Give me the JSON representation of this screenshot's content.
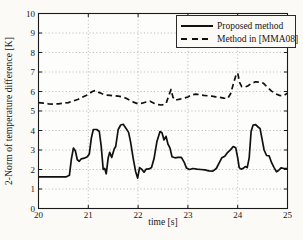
{
  "figure": {
    "ylabel": "2-Norm of temperature difference [K]",
    "xlabel": "time [s]"
  },
  "chart_data": {
    "type": "line",
    "title": "",
    "xlabel": "time [s]",
    "ylabel": "2-Norm of temperature difference [K]",
    "xlim": [
      20,
      25
    ],
    "ylim": [
      0,
      10
    ],
    "xticks": [
      20,
      21,
      22,
      23,
      24,
      25
    ],
    "yticks": [
      0,
      1,
      2,
      3,
      4,
      5,
      6,
      7,
      8,
      9,
      10
    ],
    "grid": true,
    "legend_position": "top-right",
    "axis_color": "#1a1a1a",
    "grid_color": "#9a9a9a",
    "series": [
      {
        "name": "Proposed method",
        "line_style": "solid",
        "color": "#101010",
        "points": [
          [
            20.0,
            1.62
          ],
          [
            20.3,
            1.62
          ],
          [
            20.55,
            1.62
          ],
          [
            20.62,
            1.7
          ],
          [
            20.66,
            2.55
          ],
          [
            20.7,
            3.1
          ],
          [
            20.74,
            2.95
          ],
          [
            20.78,
            2.5
          ],
          [
            20.82,
            2.42
          ],
          [
            20.86,
            2.55
          ],
          [
            20.92,
            2.58
          ],
          [
            20.98,
            2.65
          ],
          [
            21.02,
            2.8
          ],
          [
            21.06,
            3.6
          ],
          [
            21.1,
            4.05
          ],
          [
            21.17,
            4.05
          ],
          [
            21.22,
            3.95
          ],
          [
            21.26,
            3.2
          ],
          [
            21.3,
            2.0
          ],
          [
            21.33,
            2.05
          ],
          [
            21.36,
            1.78
          ],
          [
            21.4,
            2.6
          ],
          [
            21.43,
            2.88
          ],
          [
            21.47,
            2.62
          ],
          [
            21.52,
            3.05
          ],
          [
            21.55,
            3.18
          ],
          [
            21.6,
            4.05
          ],
          [
            21.65,
            4.28
          ],
          [
            21.7,
            4.32
          ],
          [
            21.76,
            4.1
          ],
          [
            21.81,
            3.9
          ],
          [
            21.85,
            3.4
          ],
          [
            21.9,
            2.6
          ],
          [
            21.95,
            1.9
          ],
          [
            21.99,
            1.56
          ],
          [
            22.03,
            2.1
          ],
          [
            22.07,
            2.02
          ],
          [
            22.12,
            1.86
          ],
          [
            22.16,
            2.02
          ],
          [
            22.22,
            2.03
          ],
          [
            22.27,
            2.1
          ],
          [
            22.32,
            2.55
          ],
          [
            22.38,
            3.45
          ],
          [
            22.44,
            3.95
          ],
          [
            22.48,
            3.88
          ],
          [
            22.52,
            3.52
          ],
          [
            22.56,
            3.7
          ],
          [
            22.6,
            3.3
          ],
          [
            22.64,
            3.1
          ],
          [
            22.68,
            2.65
          ],
          [
            22.74,
            2.6
          ],
          [
            22.8,
            2.62
          ],
          [
            22.87,
            2.62
          ],
          [
            22.93,
            2.35
          ],
          [
            22.97,
            2.08
          ],
          [
            23.03,
            2.0
          ],
          [
            23.1,
            2.05
          ],
          [
            23.18,
            2.02
          ],
          [
            23.26,
            2.0
          ],
          [
            23.34,
            1.98
          ],
          [
            23.42,
            1.93
          ],
          [
            23.5,
            1.92
          ],
          [
            23.57,
            2.05
          ],
          [
            23.63,
            2.35
          ],
          [
            23.68,
            2.6
          ],
          [
            23.74,
            2.68
          ],
          [
            23.8,
            2.88
          ],
          [
            23.86,
            3.02
          ],
          [
            23.91,
            3.18
          ],
          [
            23.96,
            3.12
          ],
          [
            24.0,
            2.6
          ],
          [
            24.03,
            2.1
          ],
          [
            24.07,
            2.02
          ],
          [
            24.11,
            2.06
          ],
          [
            24.15,
            2.15
          ],
          [
            24.19,
            2.1
          ],
          [
            24.23,
            2.6
          ],
          [
            24.27,
            3.95
          ],
          [
            24.31,
            4.28
          ],
          [
            24.36,
            4.3
          ],
          [
            24.41,
            4.18
          ],
          [
            24.45,
            4.1
          ],
          [
            24.49,
            3.55
          ],
          [
            24.53,
            3.0
          ],
          [
            24.58,
            2.72
          ],
          [
            24.63,
            2.7
          ],
          [
            24.68,
            2.35
          ],
          [
            24.73,
            2.1
          ],
          [
            24.78,
            1.88
          ],
          [
            24.82,
            1.95
          ],
          [
            24.87,
            2.08
          ],
          [
            24.93,
            2.05
          ],
          [
            25.0,
            2.05
          ]
        ]
      },
      {
        "name": "Method in [MMA08]",
        "line_style": "dashed",
        "color": "#101010",
        "points": [
          [
            20.0,
            5.43
          ],
          [
            20.1,
            5.4
          ],
          [
            20.2,
            5.37
          ],
          [
            20.3,
            5.35
          ],
          [
            20.4,
            5.37
          ],
          [
            20.5,
            5.4
          ],
          [
            20.6,
            5.43
          ],
          [
            20.7,
            5.52
          ],
          [
            20.8,
            5.6
          ],
          [
            20.9,
            5.73
          ],
          [
            21.0,
            5.85
          ],
          [
            21.08,
            6.0
          ],
          [
            21.14,
            6.05
          ],
          [
            21.2,
            5.97
          ],
          [
            21.28,
            5.88
          ],
          [
            21.36,
            5.82
          ],
          [
            21.44,
            5.8
          ],
          [
            21.52,
            5.78
          ],
          [
            21.6,
            5.76
          ],
          [
            21.68,
            5.73
          ],
          [
            21.76,
            5.65
          ],
          [
            21.84,
            5.55
          ],
          [
            21.92,
            5.44
          ],
          [
            22.0,
            5.37
          ],
          [
            22.08,
            5.4
          ],
          [
            22.16,
            5.46
          ],
          [
            22.24,
            5.5
          ],
          [
            22.32,
            5.4
          ],
          [
            22.4,
            5.33
          ],
          [
            22.48,
            5.31
          ],
          [
            22.56,
            5.38
          ],
          [
            22.62,
            5.82
          ],
          [
            22.66,
            6.1
          ],
          [
            22.7,
            5.7
          ],
          [
            22.74,
            5.55
          ],
          [
            22.82,
            5.6
          ],
          [
            22.9,
            5.64
          ],
          [
            23.0,
            5.72
          ],
          [
            23.08,
            5.83
          ],
          [
            23.16,
            5.86
          ],
          [
            23.24,
            5.84
          ],
          [
            23.32,
            5.8
          ],
          [
            23.4,
            5.78
          ],
          [
            23.48,
            5.76
          ],
          [
            23.56,
            5.73
          ],
          [
            23.64,
            5.7
          ],
          [
            23.72,
            5.66
          ],
          [
            23.8,
            5.64
          ],
          [
            23.86,
            5.9
          ],
          [
            23.92,
            6.45
          ],
          [
            23.97,
            6.88
          ],
          [
            24.0,
            6.95
          ],
          [
            24.04,
            6.45
          ],
          [
            24.08,
            6.25
          ],
          [
            24.14,
            6.22
          ],
          [
            24.2,
            6.28
          ],
          [
            24.28,
            6.42
          ],
          [
            24.36,
            6.5
          ],
          [
            24.44,
            6.48
          ],
          [
            24.52,
            6.42
          ],
          [
            24.6,
            6.2
          ],
          [
            24.68,
            6.02
          ],
          [
            24.76,
            5.88
          ],
          [
            24.84,
            5.8
          ],
          [
            24.92,
            5.78
          ],
          [
            25.0,
            5.92
          ]
        ]
      }
    ]
  }
}
